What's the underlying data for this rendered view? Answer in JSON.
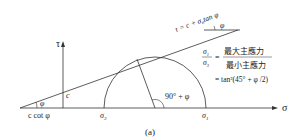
{
  "figure": {
    "caption": "(a)",
    "axes": {
      "x_label": "σ",
      "y_label": "τ"
    },
    "envelope_equation": "τ = c + σ",
    "envelope_equation_sub": "n",
    "envelope_equation_tail": "tan φ",
    "angle_top": "φ",
    "angle_left": "φ",
    "intercept_label": "c",
    "x_intercept_label": "c cot φ",
    "sigma3_label": "σ",
    "sigma3_sub": "3",
    "sigma1_label": "σ",
    "sigma1_sub": "1",
    "center_angle_label": "90° + φ",
    "ratio": {
      "numerator_symbol": "σ",
      "numerator_sub": "1",
      "denominator_symbol": "σ",
      "denominator_sub": "3",
      "equals": "=",
      "numerator_text": "最大主應力",
      "denominator_text": "最小主應力",
      "formula": "= tan²(45° + φ /2)"
    }
  }
}
